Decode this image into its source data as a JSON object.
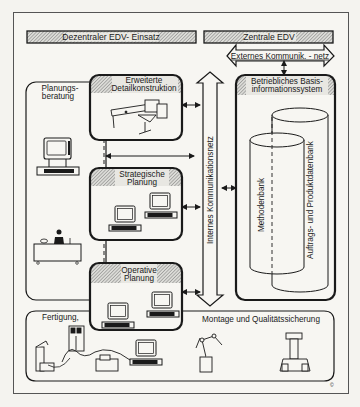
{
  "header": {
    "left_title": "Dezentraler EDV- Einsatz",
    "right_title": "Zentrale EDV"
  },
  "networks": {
    "external": "Externes Kommunik. - netz",
    "internal": "Internes Kommunikationsnetz"
  },
  "boxes": {
    "planungsberatung": [
      "Planungs-",
      "beratung"
    ],
    "detailkonstruktion": [
      "Erweiterte",
      "Detailkonstruktion"
    ],
    "strategische": [
      "Strategische",
      "Planung"
    ],
    "operative": [
      "Operative",
      "Planung"
    ],
    "basis": [
      "Betriebliches Basis-",
      "informationssystem"
    ],
    "fertigung": "Fertigung,",
    "montage": "Montage und Qualitätssicherung"
  },
  "databases": {
    "methodenbank": "Methodenbank",
    "produktdatenbank": "Auftrags- und Produktdatenbank"
  },
  "corner_mark": "©",
  "colors": {
    "ink": "#1a1a1a",
    "paper": "#f4f3ef",
    "hatch": "#8a8a8a"
  }
}
